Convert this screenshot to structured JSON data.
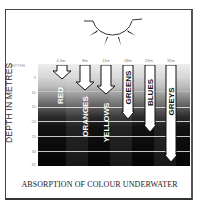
{
  "figure": {
    "title": "ABSORPTION OF COLOUR UNDERWATER",
    "y_axis_label": "DEPTH IN METRES",
    "depth_heading": "DEPTHS",
    "depth_ticks": [
      "5",
      "10",
      "15",
      "20",
      "25",
      "30",
      "35"
    ],
    "sun_icon": "sun-icon",
    "columns": [
      {
        "color": "REDS",
        "visible_label": "RED",
        "depth_label": "4.5m",
        "depth_m": 4.5
      },
      {
        "color": "ORANGES",
        "visible_label": "ORANGES",
        "depth_label": "8m",
        "depth_m": 8
      },
      {
        "color": "YELLOWS",
        "visible_label": "YELLOWS",
        "depth_label": "11m",
        "depth_m": 11
      },
      {
        "color": "GREENS",
        "visible_label": "GREENS",
        "depth_label": "18m",
        "depth_m": 18
      },
      {
        "color": "BLUES",
        "visible_label": "BLUES",
        "depth_label": "23m",
        "depth_m": 23
      },
      {
        "color": "GREYS",
        "visible_label": "GREYS",
        "depth_label": "31m",
        "depth_m": 31
      }
    ]
  }
}
